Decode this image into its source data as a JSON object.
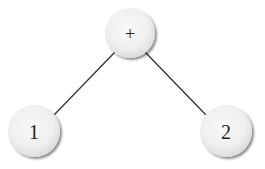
{
  "diagram": {
    "type": "expression-tree",
    "nodes": [
      {
        "id": "root",
        "label": "+",
        "cx": 130,
        "cy": 33,
        "r": 25,
        "font_size": 18
      },
      {
        "id": "left",
        "label": "1",
        "cx": 34,
        "cy": 131,
        "r": 26,
        "font_size": 20
      },
      {
        "id": "right",
        "label": "2",
        "cx": 226,
        "cy": 131,
        "r": 26,
        "font_size": 20
      }
    ],
    "edges": [
      {
        "from": "root",
        "to": "left",
        "x1": 115,
        "y1": 52,
        "x2": 54,
        "y2": 115
      },
      {
        "from": "root",
        "to": "right",
        "x1": 145,
        "y1": 52,
        "x2": 206,
        "y2": 115
      }
    ],
    "colors": {
      "node_fill_center": "#f6f6f6",
      "node_fill_edge": "#e2e2e2",
      "node_shadow": "#9a9a9a",
      "edge": "#333333",
      "text": "#222222"
    }
  }
}
